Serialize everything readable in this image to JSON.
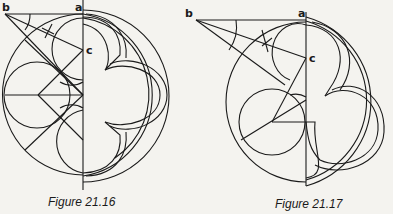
{
  "figures": [
    {
      "caption": "Figure 21.16",
      "labels": {
        "b": "b",
        "a": "a",
        "c": "c"
      },
      "description": "Construction of a four-lobed (quatrefoil) tracery within a circle; left half shows construction lines and circles, right half shows finished moulded tracery"
    },
    {
      "caption": "Figure 21.17",
      "labels": {
        "b": "b",
        "a": "a",
        "c": "c"
      },
      "description": "Construction of a three-lobed (trefoil) tracery within a circle; left half shows construction lines and circles, right half shows finished moulded tracery"
    }
  ],
  "colors": {
    "background": "#f4f3ef",
    "ink": "#1a1a1a"
  }
}
